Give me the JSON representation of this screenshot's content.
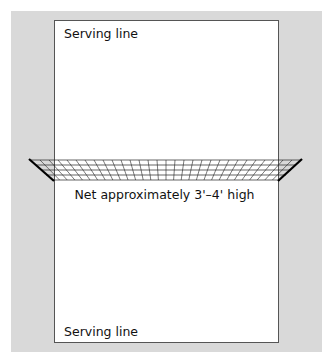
{
  "diagram": {
    "type": "court-layout",
    "top_label": "Serving line",
    "bottom_label": "Serving line",
    "net_label": "Net approximately 3'–4' high",
    "colors": {
      "background": "#d9d9d9",
      "court": "#ffffff",
      "lines": "#111111"
    }
  }
}
